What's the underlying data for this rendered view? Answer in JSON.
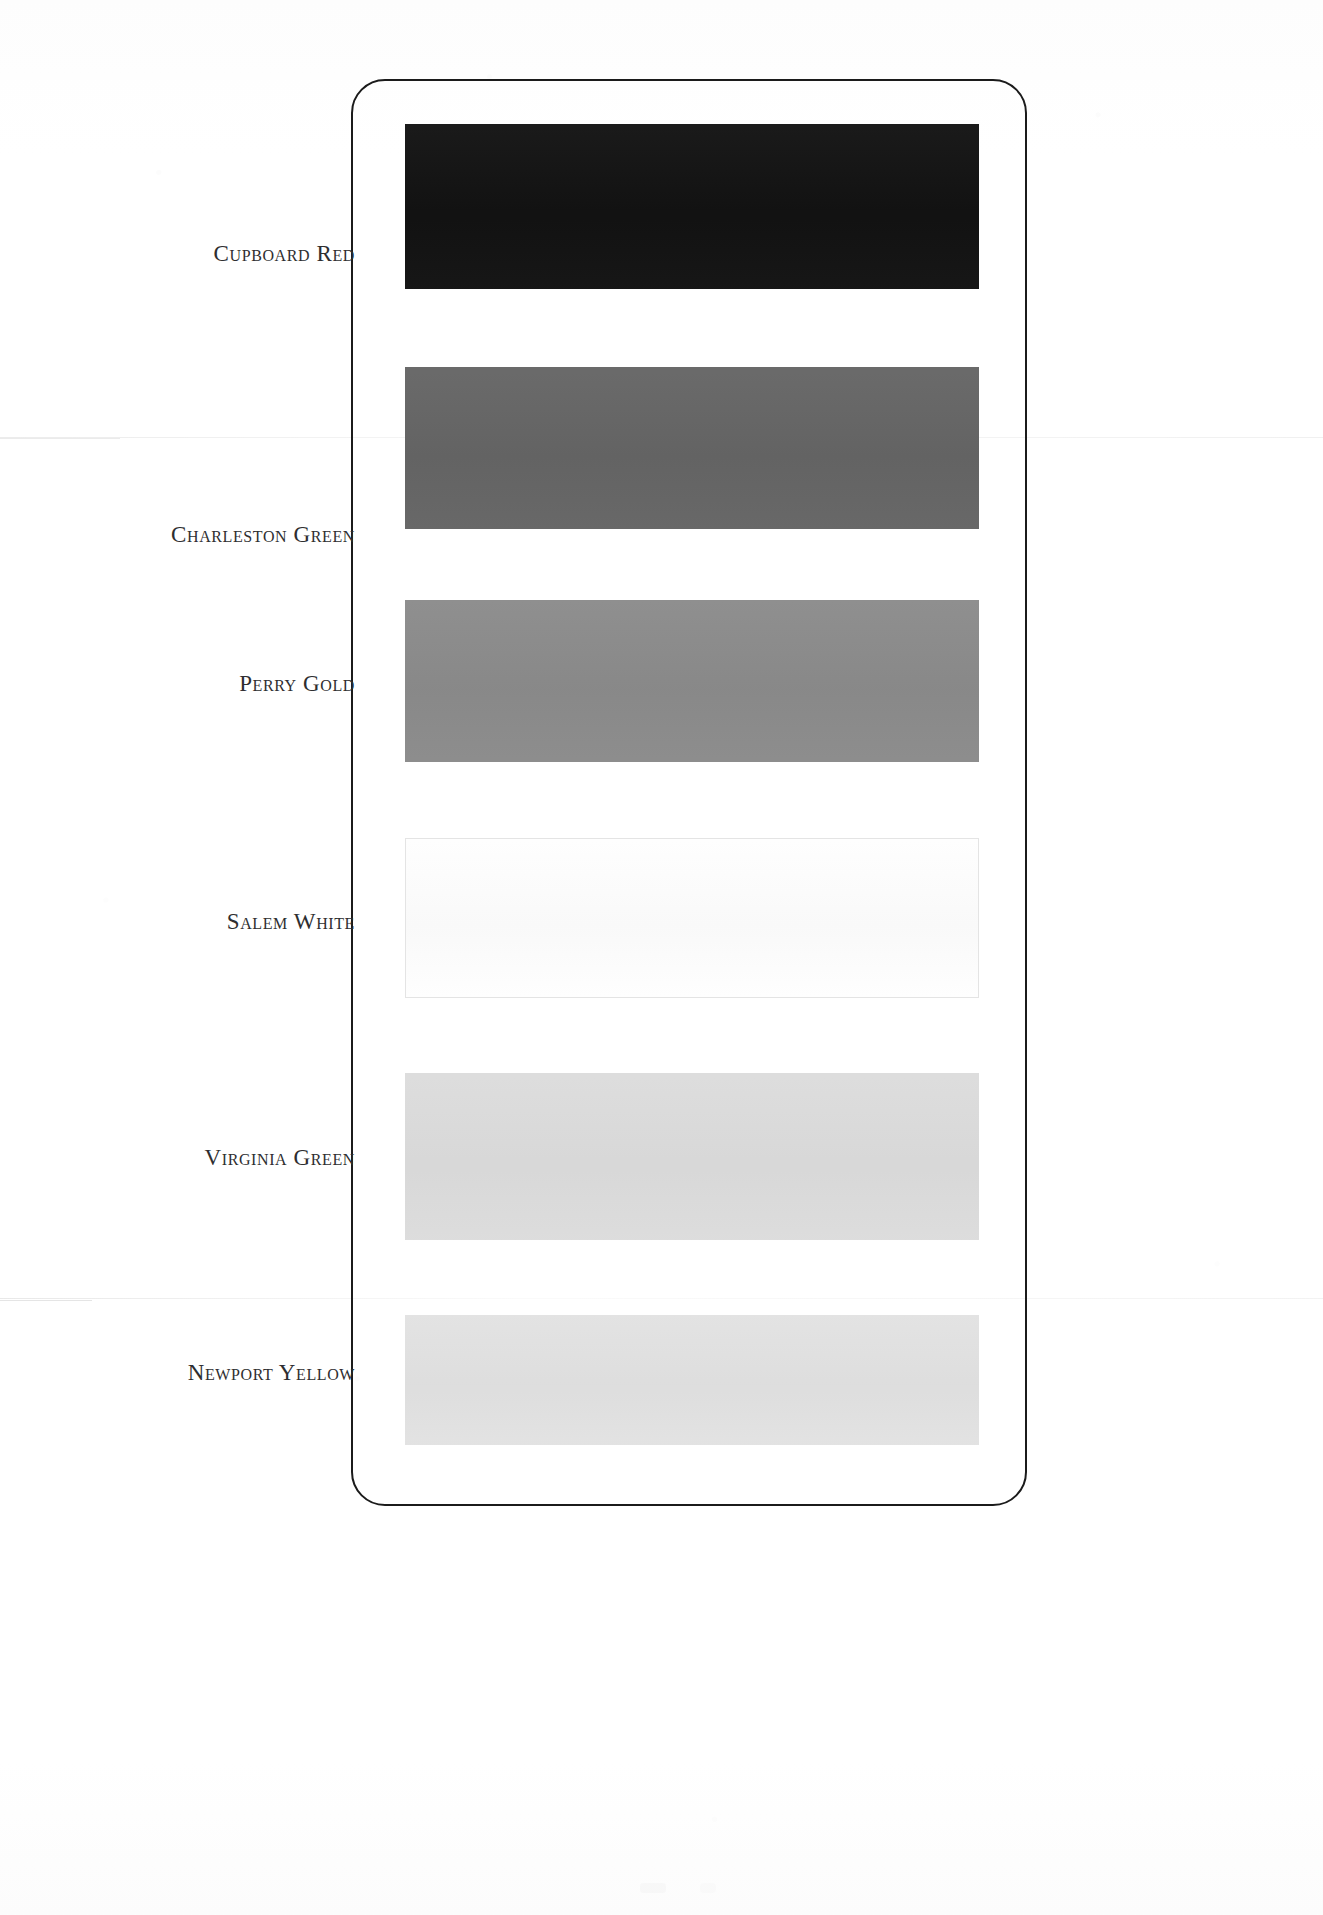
{
  "document": {
    "type": "paint-color-chart",
    "card": {
      "border_color": "#1b1b1b",
      "corner_radius": "34px"
    },
    "background_color": "#ffffff"
  },
  "swatches": [
    {
      "label": "Cupboard Red",
      "color": "#121212",
      "top": 124,
      "height": 165,
      "label_top": 241,
      "outlined": false
    },
    {
      "label": "Charleston Green",
      "color": "#656565",
      "top": 367,
      "height": 162,
      "label_top": 522,
      "outlined": false
    },
    {
      "label": "Perry Gold",
      "color": "#8b8b8b",
      "top": 600,
      "height": 162,
      "label_top": 671,
      "outlined": false
    },
    {
      "label": "Salem White",
      "color": "#fefefe",
      "top": 838,
      "height": 160,
      "label_top": 909,
      "outlined": true
    },
    {
      "label": "Virginia Green",
      "color": "#dcdcdc",
      "top": 1073,
      "height": 167,
      "label_top": 1145,
      "outlined": false
    },
    {
      "label": "Newport Yellow",
      "color": "#e2e2e2",
      "top": 1315,
      "height": 130,
      "label_top": 1360,
      "outlined": false
    }
  ]
}
